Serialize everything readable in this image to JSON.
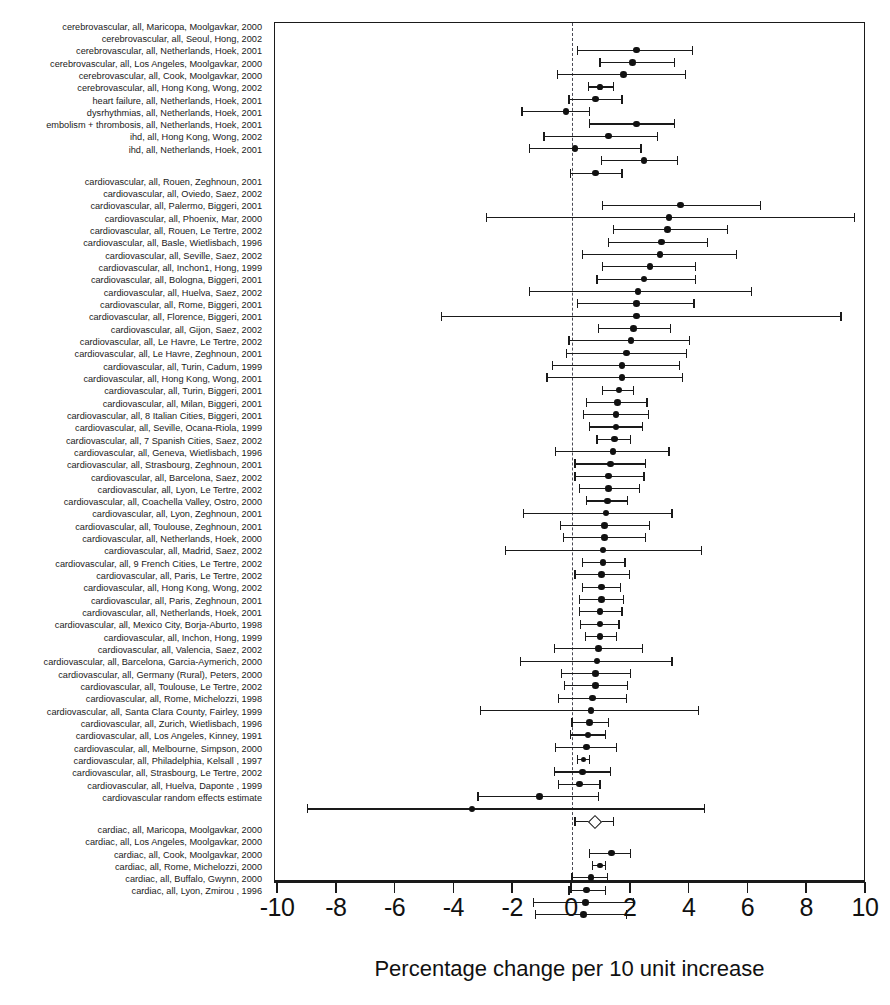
{
  "axis": {
    "xlabel": "Percentage change per 10 unit increase",
    "ticks": [
      "-10",
      "-8",
      "-6",
      "-4",
      "-2",
      "0",
      "2",
      "4",
      "6",
      "8",
      "10"
    ],
    "xlim": [
      -10,
      10
    ],
    "zero_reference": 0
  },
  "chart_data": {
    "type": "scatter",
    "plot_kind": "forest-plot",
    "title": "",
    "xlabel": "Percentage change per 10 unit increase",
    "ylabel": "",
    "xlim": [
      -10,
      10
    ],
    "xticks": [
      -10,
      -8,
      -6,
      -4,
      -2,
      0,
      2,
      4,
      6,
      8,
      10
    ],
    "grid": false,
    "legend": "none",
    "zero_line": 0,
    "marker": "filled circle with horizontal 95% CI whiskers",
    "summary_marker": "open diamond",
    "groups": [
      {
        "name": "cerebrovascular / other outcomes",
        "rows": [
          {
            "label": "cerebrovascular, all, Maricopa, Moolgavkar, 2000",
            "estimate": 2.2,
            "ci_low": 0.2,
            "ci_high": 4.1
          },
          {
            "label": "cerebrovascular, all, Seoul, Hong, 2002",
            "estimate": 2.05,
            "ci_low": 0.95,
            "ci_high": 3.5
          },
          {
            "label": "cerebrovascular, all, Netherlands, Hoek, 2001",
            "estimate": 1.75,
            "ci_low": -0.5,
            "ci_high": 3.85
          },
          {
            "label": "cerebrovascular, all, Los Angeles, Moolgavkar, 2000",
            "estimate": 0.95,
            "ci_low": 0.55,
            "ci_high": 1.4
          },
          {
            "label": "cerebrovascular, all, Cook, Moolgavkar, 2000",
            "estimate": 0.8,
            "ci_low": -0.1,
            "ci_high": 1.7
          },
          {
            "label": "cerebrovascular, all, Hong Kong, Wong, 2002",
            "estimate": -0.2,
            "ci_low": -1.7,
            "ci_high": 0.6
          },
          {
            "label": "heart failure, all, Netherlands, Hoek, 2001",
            "estimate": 2.2,
            "ci_low": 0.6,
            "ci_high": 3.5
          },
          {
            "label": "dysrhythmias, all, Netherlands, Hoek, 2001",
            "estimate": 1.25,
            "ci_low": -0.95,
            "ci_high": 2.9
          },
          {
            "label": "embolism + thrombosis, all, Netherlands, Hoek, 2001",
            "estimate": 0.1,
            "ci_low": -1.45,
            "ci_high": 2.35
          },
          {
            "label": "ihd, all, Hong Kong, Wong, 2002",
            "estimate": 2.45,
            "ci_low": 1.0,
            "ci_high": 3.6
          },
          {
            "label": "ihd, all, Netherlands, Hoek, 2001",
            "estimate": 0.8,
            "ci_low": -0.05,
            "ci_high": 1.7
          }
        ]
      },
      {
        "name": "cardiovascular",
        "rows": [
          {
            "label": "cardiovascular, all, Rouen, Zeghnoun, 2001",
            "estimate": 3.7,
            "ci_low": 1.05,
            "ci_high": 6.4
          },
          {
            "label": "cardiovascular, all, Oviedo, Saez, 2002",
            "estimate": 3.3,
            "ci_low": -2.9,
            "ci_high": 9.6
          },
          {
            "label": "cardiovascular, all, Palermo, Biggeri, 2001",
            "estimate": 3.25,
            "ci_low": 1.4,
            "ci_high": 5.3
          },
          {
            "label": "cardiovascular, all, Phoenix, Mar, 2000",
            "estimate": 3.05,
            "ci_low": 1.25,
            "ci_high": 4.6
          },
          {
            "label": "cardiovascular, all, Rouen, Le Tertre, 2002",
            "estimate": 3.0,
            "ci_low": 0.35,
            "ci_high": 5.6
          },
          {
            "label": "cardiovascular, all, Basle, Wietlisbach, 1996",
            "estimate": 2.65,
            "ci_low": 1.05,
            "ci_high": 4.2
          },
          {
            "label": "cardiovascular, all, Seville, Saez, 2002",
            "estimate": 2.45,
            "ci_low": 0.85,
            "ci_high": 4.2
          },
          {
            "label": "cardiovascular, all, Inchon1, Hong, 1999",
            "estimate": 2.25,
            "ci_low": -1.45,
            "ci_high": 6.1
          },
          {
            "label": "cardiovascular, all, Bologna, Biggeri, 2001",
            "estimate": 2.2,
            "ci_low": 0.2,
            "ci_high": 4.15
          },
          {
            "label": "cardiovascular, all, Huelva, Saez, 2002",
            "estimate": 2.2,
            "ci_low": -4.45,
            "ci_high": 9.15
          },
          {
            "label": "cardiovascular, all, Rome, Biggeri, 2001",
            "estimate": 2.1,
            "ci_low": 0.9,
            "ci_high": 3.35
          },
          {
            "label": "cardiovascular, all, Florence, Biggeri, 2001",
            "estimate": 2.0,
            "ci_low": -0.1,
            "ci_high": 4.0
          },
          {
            "label": "cardiovascular, all, Gijon, Saez, 2002",
            "estimate": 1.85,
            "ci_low": -0.2,
            "ci_high": 3.9
          },
          {
            "label": "cardiovascular, all, Le Havre, Le Tertre, 2002",
            "estimate": 1.7,
            "ci_low": -0.65,
            "ci_high": 3.65
          },
          {
            "label": "cardiovascular, all, Le Havre, Zeghnoun, 2001",
            "estimate": 1.7,
            "ci_low": -0.85,
            "ci_high": 3.75
          },
          {
            "label": "cardiovascular, all, Turin, Cadum, 1999",
            "estimate": 1.6,
            "ci_low": 1.05,
            "ci_high": 2.1
          },
          {
            "label": "cardiovascular, all, Hong Kong, Wong, 2001",
            "estimate": 1.55,
            "ci_low": 0.5,
            "ci_high": 2.55
          },
          {
            "label": "cardiovascular, all, Turin, Biggeri, 2001",
            "estimate": 1.5,
            "ci_low": 0.4,
            "ci_high": 2.6
          },
          {
            "label": "cardiovascular, all, Milan, Biggeri, 2001",
            "estimate": 1.5,
            "ci_low": 0.6,
            "ci_high": 2.4
          },
          {
            "label": "cardiovascular, all, 8 Italian Cities, Biggeri, 2001",
            "estimate": 1.45,
            "ci_low": 0.85,
            "ci_high": 2.0
          },
          {
            "label": "cardiovascular, all, Seville, Ocana-Riola, 1999",
            "estimate": 1.4,
            "ci_low": -0.55,
            "ci_high": 3.3
          },
          {
            "label": "cardiovascular, all, 7 Spanish Cities, Saez, 2002",
            "estimate": 1.3,
            "ci_low": 0.1,
            "ci_high": 2.5
          },
          {
            "label": "cardiovascular, all, Geneva, Wietlisbach, 1996",
            "estimate": 1.25,
            "ci_low": 0.1,
            "ci_high": 2.45
          },
          {
            "label": "cardiovascular, all, Strasbourg, Zeghnoun, 2001",
            "estimate": 1.25,
            "ci_low": 0.25,
            "ci_high": 2.3
          },
          {
            "label": "cardiovascular, all, Barcelona, Saez, 2002",
            "estimate": 1.2,
            "ci_low": 0.5,
            "ci_high": 1.9
          },
          {
            "label": "cardiovascular, all, Lyon, Le Tertre, 2002",
            "estimate": 1.15,
            "ci_low": -1.65,
            "ci_high": 3.4
          },
          {
            "label": "cardiovascular, all, Coachella Valley, Ostro, 2000",
            "estimate": 1.1,
            "ci_low": -0.4,
            "ci_high": 2.65
          },
          {
            "label": "cardiovascular, all, Lyon, Zeghnoun, 2001",
            "estimate": 1.1,
            "ci_low": -0.3,
            "ci_high": 2.5
          },
          {
            "label": "cardiovascular, all, Toulouse, Zeghnoun, 2001",
            "estimate": 1.05,
            "ci_low": -2.25,
            "ci_high": 4.4
          },
          {
            "label": "cardiovascular, all, Netherlands, Hoek, 2000",
            "estimate": 1.05,
            "ci_low": 0.35,
            "ci_high": 1.8
          },
          {
            "label": "cardiovascular, all, Madrid, Saez, 2002",
            "estimate": 1.0,
            "ci_low": 0.1,
            "ci_high": 1.95
          },
          {
            "label": "cardiovascular, all, 9 French Cities, Le Tertre, 2002",
            "estimate": 1.0,
            "ci_low": 0.35,
            "ci_high": 1.65
          },
          {
            "label": "cardiovascular, all, Paris, Le Tertre, 2002",
            "estimate": 1.0,
            "ci_low": 0.25,
            "ci_high": 1.75
          },
          {
            "label": "cardiovascular, all, Hong Kong, Wong, 2002",
            "estimate": 0.95,
            "ci_low": 0.25,
            "ci_high": 1.7
          },
          {
            "label": "cardiovascular, all, Paris, Zeghnoun, 2001",
            "estimate": 0.95,
            "ci_low": 0.3,
            "ci_high": 1.6
          },
          {
            "label": "cardiovascular, all, Netherlands, Hoek, 2001",
            "estimate": 0.95,
            "ci_low": 0.45,
            "ci_high": 1.5
          },
          {
            "label": "cardiovascular, all, Mexico City, Borja-Aburto, 1998",
            "estimate": 0.9,
            "ci_low": -0.6,
            "ci_high": 2.4
          },
          {
            "label": "cardiovascular, all, Inchon, Hong, 1999",
            "estimate": 0.85,
            "ci_low": -1.75,
            "ci_high": 3.4
          },
          {
            "label": "cardiovascular, all, Valencia, Saez, 2002",
            "estimate": 0.8,
            "ci_low": -0.35,
            "ci_high": 2.0
          },
          {
            "label": "cardiovascular, all, Barcelona, Garcia-Aymerich, 2000",
            "estimate": 0.8,
            "ci_low": -0.25,
            "ci_high": 1.9
          },
          {
            "label": "cardiovascular, all, Germany (Rural), Peters, 2000",
            "estimate": 0.7,
            "ci_low": -0.45,
            "ci_high": 1.85
          },
          {
            "label": "cardiovascular, all, Toulouse, Le Tertre, 2002",
            "estimate": 0.65,
            "ci_low": -3.1,
            "ci_high": 4.3
          },
          {
            "label": "cardiovascular, all, Rome, Michelozzi, 1998",
            "estimate": 0.6,
            "ci_low": 0.0,
            "ci_high": 1.25
          },
          {
            "label": "cardiovascular, all, Santa Clara County, Fairley, 1999",
            "estimate": 0.55,
            "ci_low": -0.05,
            "ci_high": 1.15
          },
          {
            "label": "cardiovascular, all, Zurich, Wietlisbach, 1996",
            "estimate": 0.5,
            "ci_low": -0.55,
            "ci_high": 1.5
          },
          {
            "label": "cardiovascular, all, Los Angeles, Kinney, 1991",
            "estimate": 0.4,
            "ci_low": 0.2,
            "ci_high": 0.6
          },
          {
            "label": "cardiovascular, all, Melbourne, Simpson, 2000",
            "estimate": 0.35,
            "ci_low": -0.6,
            "ci_high": 1.3
          },
          {
            "label": "cardiovascular, all, Philadelphia, Kelsall , 1997",
            "estimate": 0.25,
            "ci_low": -0.45,
            "ci_high": 0.95
          },
          {
            "label": "cardiovascular, all, Strasbourg, Le Tertre, 2002",
            "estimate": -1.1,
            "ci_low": -3.2,
            "ci_high": 0.9
          },
          {
            "label": "cardiovascular, all, Huelva, Daponte , 1999",
            "estimate": -3.4,
            "ci_low": -9.0,
            "ci_high": 4.5
          },
          {
            "label": "cardiovascular random effects estimate",
            "estimate": 0.75,
            "ci_low": 0.1,
            "ci_high": 1.4,
            "summary": true
          }
        ]
      },
      {
        "name": "cardiac",
        "rows": [
          {
            "label": "cardiac, all, Maricopa, Moolgavkar, 2000",
            "estimate": 1.35,
            "ci_low": 0.6,
            "ci_high": 2.0
          },
          {
            "label": "cardiac, all, Los Angeles, Moolgavkar, 2000",
            "estimate": 0.95,
            "ci_low": 0.7,
            "ci_high": 1.15
          },
          {
            "label": "cardiac, all, Cook, Moolgavkar, 2000",
            "estimate": 0.65,
            "ci_low": 0.0,
            "ci_high": 1.2
          },
          {
            "label": "cardiac, all, Rome, Michelozzi, 2000",
            "estimate": 0.5,
            "ci_low": -0.1,
            "ci_high": 1.15
          },
          {
            "label": "cardiac, all, Buffalo, Gwynn, 2000",
            "estimate": 0.45,
            "ci_low": -1.3,
            "ci_high": 2.1
          },
          {
            "label": "cardiac, all, Lyon, Zmirou , 1996",
            "estimate": 0.4,
            "ci_low": -1.25,
            "ci_high": 1.85
          }
        ]
      }
    ]
  }
}
